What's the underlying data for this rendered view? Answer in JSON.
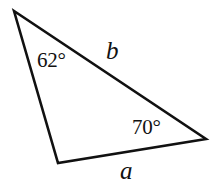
{
  "figure": {
    "type": "triangle-diagram",
    "background_color": "#ffffff",
    "stroke_color": "#111111",
    "stroke_width": 2.6,
    "width": 213,
    "height": 183,
    "vertices": {
      "apex": {
        "x": 14,
        "y": 11
      },
      "bottom_left": {
        "x": 58,
        "y": 163
      },
      "right": {
        "x": 206,
        "y": 139
      }
    },
    "angles": [
      {
        "name": "apex-angle",
        "label": "62°",
        "value": 62,
        "at_vertex": "apex"
      },
      {
        "name": "right-angle",
        "label": "70°",
        "value": 70,
        "at_vertex": "right"
      }
    ],
    "sides": [
      {
        "name": "side-a",
        "label": "a",
        "between": [
          "bottom_left",
          "right"
        ],
        "position": "below-base"
      },
      {
        "name": "side-b",
        "label": "b",
        "between": [
          "apex",
          "right"
        ],
        "position": "above-hypotenuse"
      }
    ]
  }
}
